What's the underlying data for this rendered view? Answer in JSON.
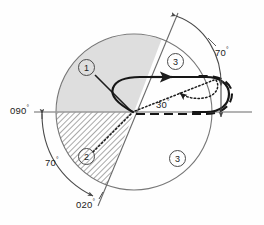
{
  "figure": {
    "type": "technical-line-drawing"
  },
  "labels": {
    "bearing_left": "090",
    "bearing_left_deg": "°",
    "angle_left": "70",
    "angle_left_deg": "°",
    "bearing_bottom": "020",
    "bearing_bottom_deg": "°",
    "angle_right": "70",
    "angle_right_deg": "°",
    "angle_center": "30",
    "angle_center_deg": "°"
  },
  "markers": {
    "item_1": "1",
    "item_2": "2",
    "item_3a": "3",
    "item_3b": "3"
  },
  "colors": {
    "stroke": "#3a3a3a",
    "outline": "#6b6b6b",
    "shade_light": "#dcdcdc",
    "hatch": "#8a8a8a",
    "accent": "#111111",
    "background": "#ffffff"
  },
  "geometry": {
    "circle_center_x": 134,
    "circle_center_y": 112,
    "circle_radius": 78,
    "baseline_y": 112
  }
}
